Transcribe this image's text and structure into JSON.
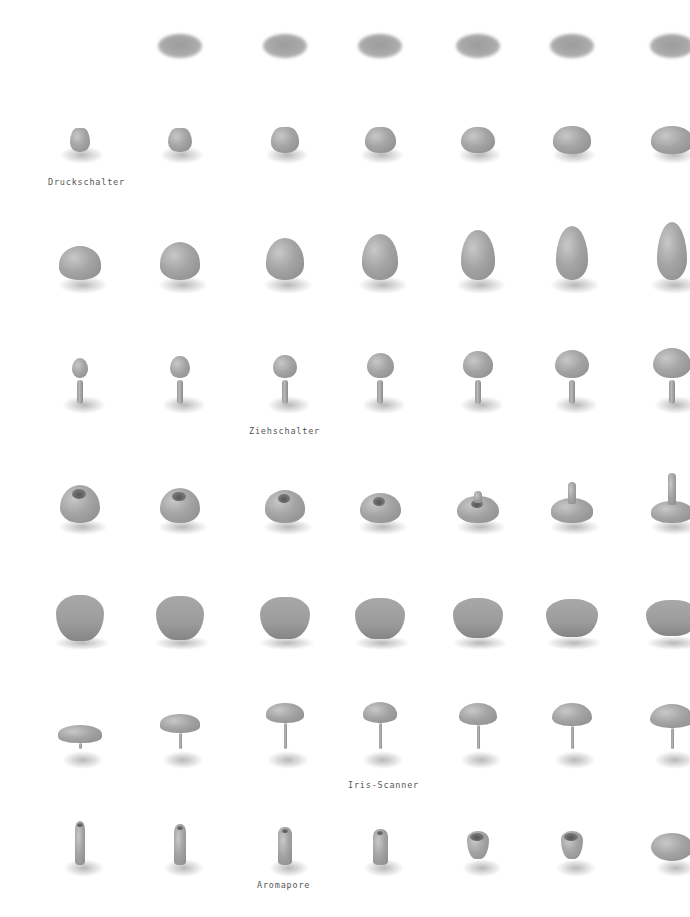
{
  "page": {
    "background": "#ffffff",
    "shape_color": "#a4a4a4",
    "label_color": "#555555"
  },
  "labels": {
    "row2": "Druckschalter",
    "row4": "Ziehschalter",
    "row7": "Iris-Scanner",
    "row8": "Aromapore"
  },
  "grid": {
    "columns_x": [
      80,
      180,
      285,
      380,
      478,
      572,
      672
    ],
    "rows": [
      {
        "name": "flat-disc-row",
        "y": 45,
        "count": 6,
        "start_col": 1
      },
      {
        "name": "druckschalter-row",
        "y": 140,
        "count": 7,
        "start_col": 0
      },
      {
        "name": "cone-drop-row",
        "y": 262,
        "count": 7,
        "start_col": 0
      },
      {
        "name": "ziehschalter-row",
        "y": 382,
        "count": 7,
        "start_col": 0
      },
      {
        "name": "hole-knob-row",
        "y": 505,
        "count": 7,
        "start_col": 0
      },
      {
        "name": "large-knob-row",
        "y": 618,
        "count": 7,
        "start_col": 0
      },
      {
        "name": "iris-scanner-row",
        "y": 735,
        "count": 7,
        "start_col": 0
      },
      {
        "name": "aromapore-row",
        "y": 845,
        "count": 7,
        "start_col": 0
      }
    ]
  }
}
